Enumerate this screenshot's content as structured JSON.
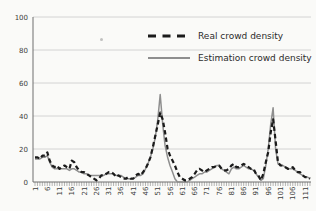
{
  "chart_data": {
    "type": "line",
    "title": "",
    "xlabel": "",
    "ylabel": "",
    "x_start": 1,
    "x_end": 113,
    "x_tick_labels": [
      "1",
      "6",
      "11",
      "16",
      "21",
      "26",
      "31",
      "36",
      "41",
      "46",
      "51",
      "56",
      "61",
      "66",
      "71",
      "76",
      "81",
      "86",
      "91",
      "96",
      "101",
      "106",
      "111"
    ],
    "y_ticks": [
      0,
      20,
      40,
      60,
      80,
      100
    ],
    "ylim": [
      0,
      100
    ],
    "grid": "horizontal-only",
    "legend_position": "upper-right-inside",
    "series": [
      {
        "name": "Real crowd density",
        "type": "line",
        "style": "dashed",
        "color": "#1b1b1b",
        "values": [
          15,
          15,
          14,
          16,
          16,
          18,
          13,
          10,
          9,
          10,
          8,
          9,
          10,
          9,
          8,
          13,
          12,
          9,
          7,
          6,
          6,
          5,
          4,
          3,
          2,
          1,
          2,
          4,
          4,
          5,
          6,
          6,
          5,
          3,
          4,
          3,
          2,
          2,
          3,
          2,
          2,
          4,
          5,
          4,
          6,
          8,
          11,
          15,
          21,
          28,
          35,
          42,
          38,
          30,
          20,
          16,
          13,
          10,
          6,
          3,
          2,
          1,
          1,
          2,
          3,
          5,
          7,
          8,
          7,
          6,
          7,
          8,
          9,
          9,
          10,
          10,
          8,
          7,
          7,
          8,
          10,
          11,
          9,
          9,
          10,
          11,
          10,
          9,
          8,
          8,
          5,
          4,
          1,
          5,
          12,
          18,
          30,
          38,
          25,
          12,
          10,
          10,
          9,
          8,
          8,
          9,
          7,
          6,
          6,
          4,
          3,
          3,
          2
        ]
      },
      {
        "name": "Estimation crowd density",
        "type": "line",
        "style": "solid",
        "color": "#8e8e8e",
        "values": [
          14,
          14,
          14,
          15,
          15,
          16,
          12,
          9,
          8,
          8,
          8,
          8,
          8,
          8,
          7,
          8,
          8,
          7,
          6,
          6,
          5,
          5,
          4,
          4,
          4,
          4,
          4,
          4,
          4,
          5,
          5,
          5,
          5,
          4,
          4,
          4,
          3,
          2,
          2,
          2,
          2,
          3,
          4,
          4,
          5,
          8,
          11,
          15,
          20,
          27,
          38,
          53,
          35,
          22,
          15,
          10,
          6,
          2,
          0,
          0,
          0,
          0,
          0,
          1,
          2,
          3,
          4,
          5,
          5,
          6,
          6,
          7,
          8,
          9,
          10,
          10,
          8,
          7,
          6,
          5,
          8,
          9,
          8,
          8,
          9,
          10,
          9,
          8,
          8,
          7,
          5,
          3,
          1,
          2,
          10,
          20,
          35,
          45,
          20,
          11,
          10,
          10,
          9,
          8,
          8,
          8,
          7,
          6,
          5,
          4,
          3,
          3,
          2
        ]
      }
    ]
  },
  "colors": {
    "background": "#fafaf8",
    "gridline": "#c9c9c9",
    "axis": "#6e6e6e",
    "tick_label": "#3c3c3c",
    "legend_text": "#2b2b2b"
  }
}
